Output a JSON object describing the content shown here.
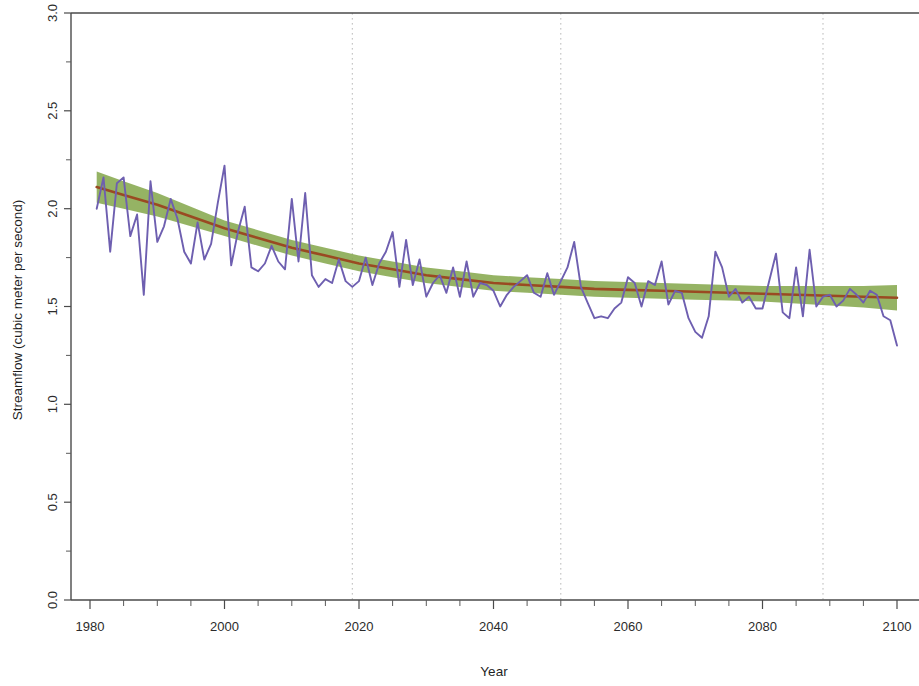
{
  "chart_data": {
    "type": "line",
    "title": "",
    "xlabel": "Year",
    "ylabel": "Streamflow (cubic meter per second)",
    "xlim": [
      1980,
      2100
    ],
    "ylim": [
      0.0,
      3.0
    ],
    "grid": "vertical dotted gridlines at 2019, 2050, 2089",
    "legend": "none",
    "x_ticks_major": [
      1980,
      2000,
      2020,
      2040,
      2060,
      2080,
      2100
    ],
    "x_tick_labels": [
      "1980",
      "2000",
      "2020",
      "2040",
      "2060",
      "2080",
      "2100"
    ],
    "x_ticks_minor": [
      1985,
      1990,
      1995,
      2005,
      2010,
      2015,
      2025,
      2030,
      2035,
      2045,
      2050,
      2055,
      2065,
      2070,
      2075,
      2085,
      2090,
      2095
    ],
    "y_ticks_major": [
      0.0,
      0.5,
      1.0,
      1.5,
      2.0,
      2.5,
      3.0
    ],
    "y_tick_labels": [
      "0.0",
      "0.5",
      "1.0",
      "1.5",
      "2.0",
      "2.5",
      "3.0"
    ],
    "y_ticks_minor": [
      0.25,
      0.75,
      1.25,
      1.75,
      2.25,
      2.75
    ],
    "gridline_years": [
      2019,
      2050,
      2089
    ],
    "colors": {
      "series": "#6e5fb0",
      "trend": "#9a4a22",
      "confidence_band": "#86a84e",
      "axis": "#4a4a4a",
      "gridline": "#b9b9b9",
      "background": "#ffffff"
    },
    "series": [
      {
        "name": "Annual streamflow",
        "style": "line",
        "color": "#6e5fb0",
        "x": [
          1981,
          1982,
          1983,
          1984,
          1985,
          1986,
          1987,
          1988,
          1989,
          1990,
          1991,
          1992,
          1993,
          1994,
          1995,
          1996,
          1997,
          1998,
          1999,
          2000,
          2001,
          2002,
          2003,
          2004,
          2005,
          2006,
          2007,
          2008,
          2009,
          2010,
          2011,
          2012,
          2013,
          2014,
          2015,
          2016,
          2017,
          2018,
          2019,
          2020,
          2021,
          2022,
          2023,
          2024,
          2025,
          2026,
          2027,
          2028,
          2029,
          2030,
          2031,
          2032,
          2033,
          2034,
          2035,
          2036,
          2037,
          2038,
          2039,
          2040,
          2041,
          2042,
          2043,
          2044,
          2045,
          2046,
          2047,
          2048,
          2049,
          2050,
          2051,
          2052,
          2053,
          2054,
          2055,
          2056,
          2057,
          2058,
          2059,
          2060,
          2061,
          2062,
          2063,
          2064,
          2065,
          2066,
          2067,
          2068,
          2069,
          2070,
          2071,
          2072,
          2073,
          2074,
          2075,
          2076,
          2077,
          2078,
          2079,
          2080,
          2081,
          2082,
          2083,
          2084,
          2085,
          2086,
          2087,
          2088,
          2089,
          2090,
          2091,
          2092,
          2093,
          2094,
          2095,
          2096,
          2097,
          2098,
          2099,
          2100
        ],
        "values": [
          2.0,
          2.16,
          1.78,
          2.13,
          2.16,
          1.86,
          1.97,
          1.56,
          2.14,
          1.83,
          1.91,
          2.05,
          1.95,
          1.78,
          1.72,
          1.93,
          1.74,
          1.82,
          2.03,
          2.22,
          1.71,
          1.88,
          2.01,
          1.7,
          1.68,
          1.72,
          1.81,
          1.73,
          1.69,
          2.05,
          1.73,
          2.08,
          1.66,
          1.6,
          1.64,
          1.62,
          1.74,
          1.63,
          1.6,
          1.63,
          1.75,
          1.61,
          1.72,
          1.78,
          1.88,
          1.6,
          1.84,
          1.61,
          1.74,
          1.55,
          1.62,
          1.66,
          1.57,
          1.7,
          1.55,
          1.73,
          1.55,
          1.62,
          1.61,
          1.58,
          1.5,
          1.56,
          1.6,
          1.63,
          1.66,
          1.57,
          1.55,
          1.67,
          1.56,
          1.63,
          1.7,
          1.83,
          1.6,
          1.52,
          1.44,
          1.45,
          1.44,
          1.49,
          1.52,
          1.65,
          1.62,
          1.5,
          1.63,
          1.61,
          1.73,
          1.51,
          1.58,
          1.57,
          1.44,
          1.37,
          1.34,
          1.45,
          1.78,
          1.7,
          1.55,
          1.59,
          1.52,
          1.55,
          1.49,
          1.49,
          1.63,
          1.77,
          1.47,
          1.44,
          1.7,
          1.45,
          1.79,
          1.5,
          1.55,
          1.56,
          1.5,
          1.53,
          1.59,
          1.56,
          1.52,
          1.58,
          1.56,
          1.45,
          1.43,
          1.3
        ]
      },
      {
        "name": "Fitted trend",
        "style": "line",
        "color": "#9a4a22",
        "x": [
          1981,
          1985,
          1990,
          1995,
          2000,
          2005,
          2010,
          2015,
          2020,
          2025,
          2030,
          2035,
          2040,
          2045,
          2050,
          2055,
          2060,
          2065,
          2070,
          2075,
          2080,
          2085,
          2090,
          2095,
          2100
        ],
        "values": [
          2.11,
          2.07,
          2.02,
          1.96,
          1.9,
          1.85,
          1.8,
          1.76,
          1.72,
          1.69,
          1.66,
          1.64,
          1.62,
          1.61,
          1.6,
          1.59,
          1.585,
          1.58,
          1.575,
          1.57,
          1.565,
          1.56,
          1.555,
          1.55,
          1.545
        ]
      },
      {
        "name": "95% confidence band",
        "style": "band",
        "color": "#86a84e",
        "x": [
          1981,
          1985,
          1990,
          1995,
          2000,
          2005,
          2010,
          2015,
          2020,
          2025,
          2030,
          2035,
          2040,
          2045,
          2050,
          2055,
          2060,
          2065,
          2070,
          2075,
          2080,
          2085,
          2090,
          2095,
          2100
        ],
        "lower": [
          2.03,
          2.0,
          1.96,
          1.91,
          1.86,
          1.81,
          1.76,
          1.72,
          1.68,
          1.65,
          1.62,
          1.6,
          1.58,
          1.57,
          1.56,
          1.55,
          1.545,
          1.54,
          1.535,
          1.53,
          1.525,
          1.515,
          1.505,
          1.495,
          1.48
        ],
        "upper": [
          2.19,
          2.14,
          2.08,
          2.01,
          1.94,
          1.89,
          1.84,
          1.8,
          1.76,
          1.73,
          1.7,
          1.68,
          1.66,
          1.65,
          1.64,
          1.63,
          1.625,
          1.62,
          1.615,
          1.61,
          1.605,
          1.605,
          1.605,
          1.605,
          1.61
        ]
      }
    ]
  },
  "axes": {
    "y_axis_title": "Streamflow (cubic meter per second)",
    "x_axis_title": "Year"
  }
}
